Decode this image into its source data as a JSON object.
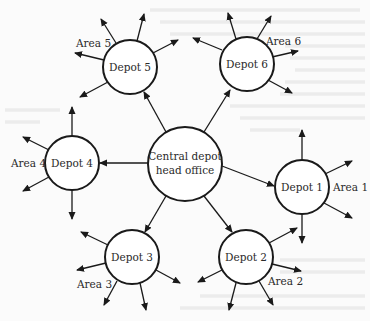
{
  "diagram": {
    "type": "hub-and-spoke distribution network",
    "colors": {
      "line": "#1a1a1a",
      "node_fill": "#ffffff",
      "background": "#fbfbfb"
    },
    "center": {
      "id": "central",
      "line1": "Central depot",
      "line2": "head office",
      "x": 185,
      "y": 164,
      "r": 37
    },
    "depots": [
      {
        "id": "depot1",
        "label": "Depot 1",
        "x": 302,
        "y": 187,
        "r": 27,
        "area": "Area 1"
      },
      {
        "id": "depot2",
        "label": "Depot 2",
        "x": 246,
        "y": 257,
        "r": 27,
        "area": "Area 2"
      },
      {
        "id": "depot3",
        "label": "Depot 3",
        "x": 132,
        "y": 257,
        "r": 27,
        "area": "Area 3"
      },
      {
        "id": "depot4",
        "label": "Depot 4",
        "x": 72,
        "y": 163,
        "r": 27,
        "area": "Area 4"
      },
      {
        "id": "depot5",
        "label": "Depot 5",
        "x": 130,
        "y": 67,
        "r": 27,
        "area": "Area 5"
      },
      {
        "id": "depot6",
        "label": "Depot 6",
        "x": 247,
        "y": 64,
        "r": 27,
        "area": "Area 6"
      }
    ]
  }
}
